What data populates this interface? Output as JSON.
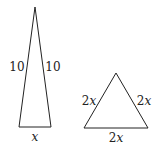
{
  "triangles": [
    {
      "name": "isosceles",
      "left_side": "10",
      "right_side": "10",
      "base": "x"
    },
    {
      "name": "equilateral",
      "left_side_coef": "2",
      "left_side_var": "x",
      "right_side_coef": "2",
      "right_side_var": "x",
      "base_coef": "2",
      "base_var": "x"
    }
  ],
  "colors": {
    "stroke": "#222222"
  }
}
